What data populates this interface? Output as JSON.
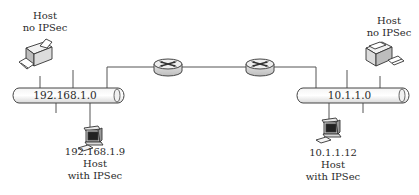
{
  "diagram": {
    "type": "network",
    "networks": [
      {
        "id": "left-lan",
        "label": "192.168.1.0"
      },
      {
        "id": "right-lan",
        "label": "10.1.1.0"
      }
    ],
    "routers": [
      {
        "id": "router-1"
      },
      {
        "id": "router-2"
      }
    ],
    "hosts": [
      {
        "id": "left-printer",
        "network": "left-lan",
        "lines": [
          "Host",
          "no IPSec"
        ]
      },
      {
        "id": "left-computer",
        "network": "left-lan",
        "lines": [
          "192.168.1.9",
          "Host",
          "with IPSec"
        ]
      },
      {
        "id": "right-printer",
        "network": "right-lan",
        "lines": [
          "Host",
          "no IPSec"
        ]
      },
      {
        "id": "right-computer",
        "network": "right-lan",
        "lines": [
          "10.1.1.12",
          "Host",
          "with IPSec"
        ]
      }
    ]
  }
}
